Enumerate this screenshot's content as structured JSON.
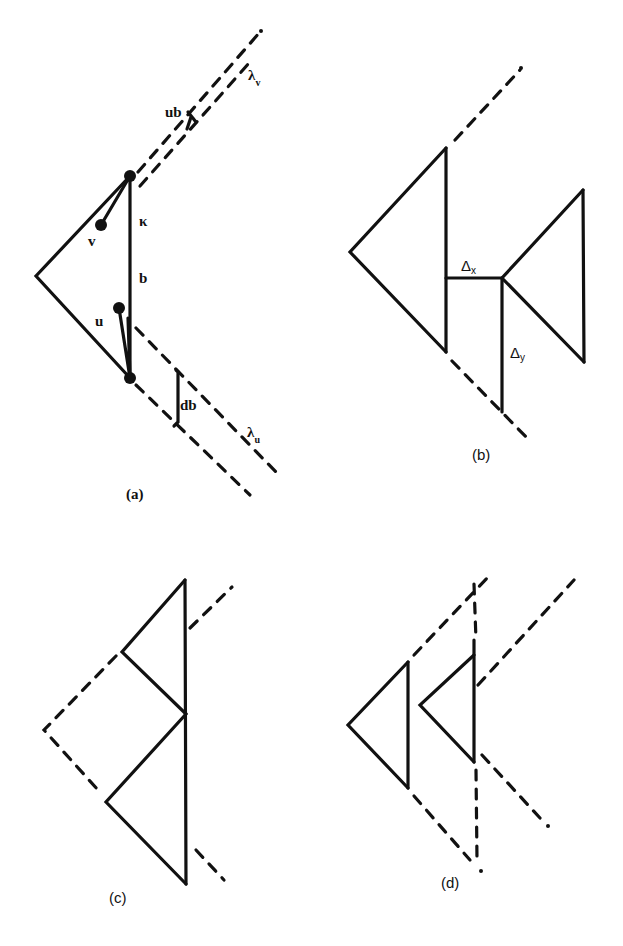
{
  "figure": {
    "panels": [
      {
        "id": "a",
        "caption": "(a)",
        "labels": {
          "ub": "ub",
          "lambda_v": "λ",
          "lambda_v_sub": "v",
          "v": "v",
          "kappa": "κ",
          "b": "b",
          "u": "u",
          "db": "db",
          "lambda_u": "λ",
          "lambda_u_sub": "u"
        }
      },
      {
        "id": "b",
        "caption": "(b)",
        "labels": {
          "delta_x": "Δ",
          "delta_x_sub": "x",
          "delta_y": "Δ",
          "delta_y_sub": "y"
        }
      },
      {
        "id": "c",
        "caption": "(c)"
      },
      {
        "id": "d",
        "caption": "(d)"
      }
    ],
    "colors": {
      "ink": "#111111",
      "background": "#ffffff"
    }
  }
}
